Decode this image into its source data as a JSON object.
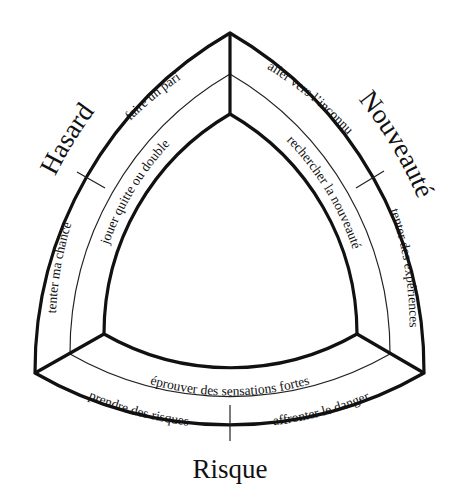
{
  "diagram": {
    "type": "reuleaux-triangle-bands",
    "categories": {
      "hasard": "Hasard",
      "nouveaute": "Nouveauté",
      "risque": "Risque"
    },
    "outer_band": {
      "hasard_upper": "faire un pari",
      "hasard_lower": "tenter ma chance",
      "nouveaute_upper": "aller vers l’inconnu",
      "nouveaute_lower": "tenter des expériences",
      "risque_left": "prendre des risques",
      "risque_right": "affronter le danger"
    },
    "inner_band": {
      "hasard": "jouer quitte ou double",
      "nouveaute": "rechercher la nouveauté",
      "risque": "éprouver des sensations fortes"
    },
    "colors": {
      "line": "#111111",
      "background": "#ffffff"
    }
  }
}
